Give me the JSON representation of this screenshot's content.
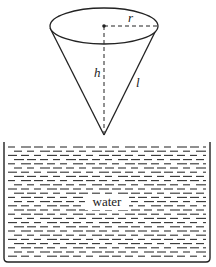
{
  "diagram": {
    "labels": {
      "radius": "r",
      "height": "h",
      "slant": "l",
      "liquid": "water"
    },
    "colors": {
      "ink": "#222222",
      "background": "#ffffff"
    }
  }
}
